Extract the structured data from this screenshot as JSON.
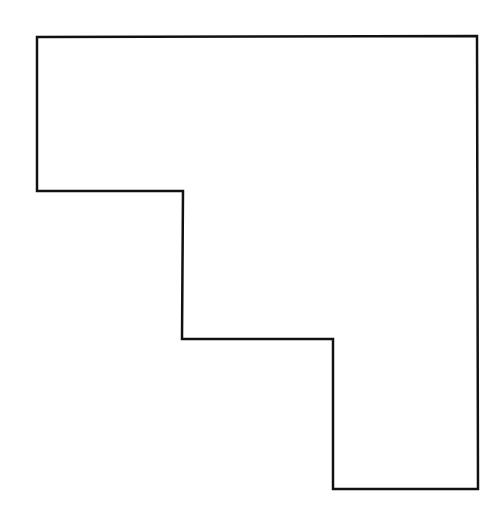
{
  "figure": {
    "stroke_color": "#111111",
    "background_color": "#ffffff",
    "stroke_width": 2.5,
    "polygon_points": [
      [
        37,
        37
      ],
      [
        477,
        36
      ],
      [
        478,
        489
      ],
      [
        333,
        489
      ],
      [
        333,
        339
      ],
      [
        182,
        339
      ],
      [
        183,
        191
      ],
      [
        37,
        191
      ]
    ]
  }
}
